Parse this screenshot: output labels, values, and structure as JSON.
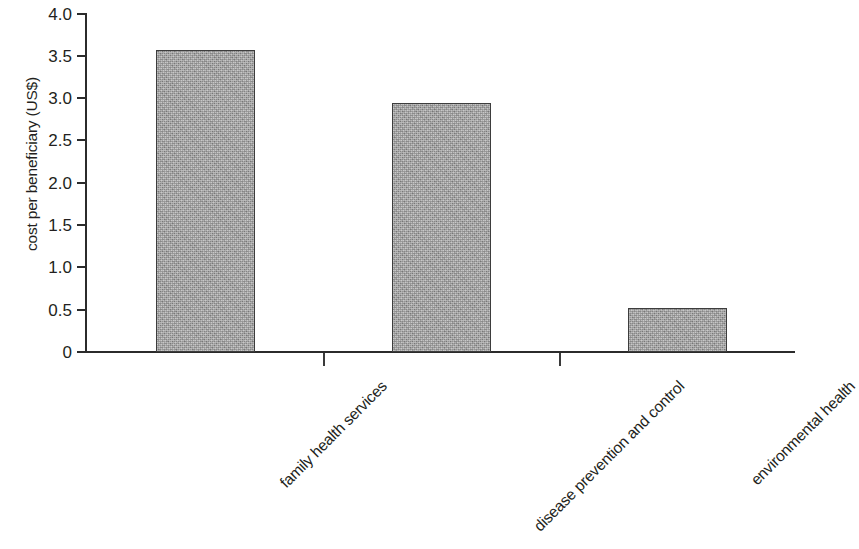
{
  "chart_data": {
    "type": "bar",
    "title": "",
    "xlabel": "",
    "ylabel": "cost per beneficiary (US$)",
    "categories": [
      "family health services",
      "disease prevention and control",
      "environmental health"
    ],
    "values": [
      3.57,
      2.94,
      0.52
    ],
    "ylim": [
      0,
      4.0
    ],
    "y_ticks": [
      0,
      0.5,
      1.0,
      1.5,
      2.0,
      2.5,
      3.0,
      3.5,
      4.0
    ],
    "y_tick_labels": [
      "0",
      "0.5",
      "1.0",
      "1.5",
      "2.0",
      "2.5",
      "3.0",
      "3.5",
      "4.0"
    ],
    "grid": false,
    "legend": false,
    "legend_position": "none",
    "bar_fill_color": "#a6a6a6",
    "bar_edge_color": "#3d3d3d",
    "axis_color": "#2b2b2b",
    "text_color": "#231f20",
    "background_color": "#ffffff",
    "x_label_rotation_degrees": 45
  }
}
